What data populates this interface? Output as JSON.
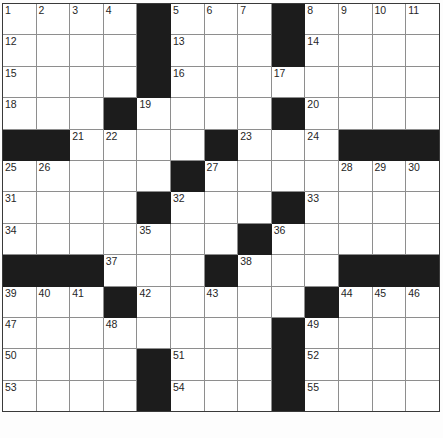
{
  "puzzle": {
    "kind": "crossword-grid",
    "rows": 13,
    "columns": 13,
    "cell_size_px": 33.7,
    "colors": {
      "block": "#1c1c1c",
      "open": "#ffffff",
      "grid_line": "#8e8e8e",
      "frame": "#3a3a3a",
      "number_text": "#262626"
    },
    "footer_artifact": "",
    "grid": [
      [
        {
          "type": "open",
          "number": "1"
        },
        {
          "type": "open",
          "number": "2"
        },
        {
          "type": "open",
          "number": "3"
        },
        {
          "type": "open",
          "number": "4"
        },
        {
          "type": "block",
          "number": ""
        },
        {
          "type": "open",
          "number": "5"
        },
        {
          "type": "open",
          "number": "6"
        },
        {
          "type": "open",
          "number": "7"
        },
        {
          "type": "block",
          "number": ""
        },
        {
          "type": "open",
          "number": "8"
        },
        {
          "type": "open",
          "number": "9"
        },
        {
          "type": "open",
          "number": "10"
        },
        {
          "type": "open",
          "number": "11"
        }
      ],
      [
        {
          "type": "open",
          "number": "12"
        },
        {
          "type": "open",
          "number": ""
        },
        {
          "type": "open",
          "number": ""
        },
        {
          "type": "open",
          "number": ""
        },
        {
          "type": "block",
          "number": ""
        },
        {
          "type": "open",
          "number": "13"
        },
        {
          "type": "open",
          "number": ""
        },
        {
          "type": "open",
          "number": ""
        },
        {
          "type": "block",
          "number": ""
        },
        {
          "type": "open",
          "number": "14"
        },
        {
          "type": "open",
          "number": ""
        },
        {
          "type": "open",
          "number": ""
        },
        {
          "type": "open",
          "number": ""
        }
      ],
      [
        {
          "type": "open",
          "number": "15"
        },
        {
          "type": "open",
          "number": ""
        },
        {
          "type": "open",
          "number": ""
        },
        {
          "type": "open",
          "number": ""
        },
        {
          "type": "block",
          "number": ""
        },
        {
          "type": "open",
          "number": "16"
        },
        {
          "type": "open",
          "number": ""
        },
        {
          "type": "open",
          "number": ""
        },
        {
          "type": "open",
          "number": "17"
        },
        {
          "type": "open",
          "number": ""
        },
        {
          "type": "open",
          "number": ""
        },
        {
          "type": "open",
          "number": ""
        },
        {
          "type": "open",
          "number": ""
        }
      ],
      [
        {
          "type": "open",
          "number": "18"
        },
        {
          "type": "open",
          "number": ""
        },
        {
          "type": "open",
          "number": ""
        },
        {
          "type": "block",
          "number": ""
        },
        {
          "type": "open",
          "number": "19"
        },
        {
          "type": "open",
          "number": ""
        },
        {
          "type": "open",
          "number": ""
        },
        {
          "type": "open",
          "number": ""
        },
        {
          "type": "block",
          "number": ""
        },
        {
          "type": "open",
          "number": "20"
        },
        {
          "type": "open",
          "number": ""
        },
        {
          "type": "open",
          "number": ""
        },
        {
          "type": "open",
          "number": ""
        }
      ],
      [
        {
          "type": "block",
          "number": ""
        },
        {
          "type": "block",
          "number": ""
        },
        {
          "type": "open",
          "number": "21"
        },
        {
          "type": "open",
          "number": "22"
        },
        {
          "type": "open",
          "number": ""
        },
        {
          "type": "open",
          "number": ""
        },
        {
          "type": "block",
          "number": ""
        },
        {
          "type": "open",
          "number": "23"
        },
        {
          "type": "open",
          "number": ""
        },
        {
          "type": "open",
          "number": "24"
        },
        {
          "type": "block",
          "number": ""
        },
        {
          "type": "block",
          "number": ""
        },
        {
          "type": "block",
          "number": ""
        }
      ],
      [
        {
          "type": "open",
          "number": "25"
        },
        {
          "type": "open",
          "number": "26"
        },
        {
          "type": "open",
          "number": ""
        },
        {
          "type": "open",
          "number": ""
        },
        {
          "type": "open",
          "number": ""
        },
        {
          "type": "block",
          "number": ""
        },
        {
          "type": "open",
          "number": "27"
        },
        {
          "type": "open",
          "number": ""
        },
        {
          "type": "open",
          "number": ""
        },
        {
          "type": "open",
          "number": ""
        },
        {
          "type": "open",
          "number": "28"
        },
        {
          "type": "open",
          "number": "29"
        },
        {
          "type": "open",
          "number": "30"
        }
      ],
      [
        {
          "type": "open",
          "number": "31"
        },
        {
          "type": "open",
          "number": ""
        },
        {
          "type": "open",
          "number": ""
        },
        {
          "type": "open",
          "number": ""
        },
        {
          "type": "block",
          "number": ""
        },
        {
          "type": "open",
          "number": "32"
        },
        {
          "type": "open",
          "number": ""
        },
        {
          "type": "open",
          "number": ""
        },
        {
          "type": "block",
          "number": ""
        },
        {
          "type": "open",
          "number": "33"
        },
        {
          "type": "open",
          "number": ""
        },
        {
          "type": "open",
          "number": ""
        },
        {
          "type": "open",
          "number": ""
        }
      ],
      [
        {
          "type": "open",
          "number": "34"
        },
        {
          "type": "open",
          "number": ""
        },
        {
          "type": "open",
          "number": ""
        },
        {
          "type": "open",
          "number": ""
        },
        {
          "type": "open",
          "number": "35"
        },
        {
          "type": "open",
          "number": ""
        },
        {
          "type": "open",
          "number": ""
        },
        {
          "type": "block",
          "number": ""
        },
        {
          "type": "open",
          "number": "36"
        },
        {
          "type": "open",
          "number": ""
        },
        {
          "type": "open",
          "number": ""
        },
        {
          "type": "open",
          "number": ""
        },
        {
          "type": "open",
          "number": ""
        }
      ],
      [
        {
          "type": "block",
          "number": ""
        },
        {
          "type": "block",
          "number": ""
        },
        {
          "type": "block",
          "number": ""
        },
        {
          "type": "open",
          "number": "37"
        },
        {
          "type": "open",
          "number": ""
        },
        {
          "type": "open",
          "number": ""
        },
        {
          "type": "block",
          "number": ""
        },
        {
          "type": "open",
          "number": "38"
        },
        {
          "type": "open",
          "number": ""
        },
        {
          "type": "open",
          "number": ""
        },
        {
          "type": "block",
          "number": ""
        },
        {
          "type": "block",
          "number": ""
        },
        {
          "type": "block",
          "number": ""
        }
      ],
      [
        {
          "type": "open",
          "number": "39"
        },
        {
          "type": "open",
          "number": "40"
        },
        {
          "type": "open",
          "number": "41"
        },
        {
          "type": "block",
          "number": ""
        },
        {
          "type": "open",
          "number": "42"
        },
        {
          "type": "open",
          "number": ""
        },
        {
          "type": "open",
          "number": "43"
        },
        {
          "type": "open",
          "number": ""
        },
        {
          "type": "open",
          "number": ""
        },
        {
          "type": "block",
          "number": ""
        },
        {
          "type": "open",
          "number": "44"
        },
        {
          "type": "open",
          "number": "45"
        },
        {
          "type": "open",
          "number": "46"
        }
      ],
      [
        {
          "type": "open",
          "number": "47"
        },
        {
          "type": "open",
          "number": ""
        },
        {
          "type": "open",
          "number": ""
        },
        {
          "type": "open",
          "number": "48"
        },
        {
          "type": "open",
          "number": ""
        },
        {
          "type": "open",
          "number": ""
        },
        {
          "type": "open",
          "number": ""
        },
        {
          "type": "open",
          "number": ""
        },
        {
          "type": "block",
          "number": ""
        },
        {
          "type": "open",
          "number": "49"
        },
        {
          "type": "open",
          "number": ""
        },
        {
          "type": "open",
          "number": ""
        },
        {
          "type": "open",
          "number": ""
        }
      ],
      [
        {
          "type": "open",
          "number": "50"
        },
        {
          "type": "open",
          "number": ""
        },
        {
          "type": "open",
          "number": ""
        },
        {
          "type": "open",
          "number": ""
        },
        {
          "type": "block",
          "number": ""
        },
        {
          "type": "open",
          "number": "51"
        },
        {
          "type": "open",
          "number": ""
        },
        {
          "type": "open",
          "number": ""
        },
        {
          "type": "block",
          "number": ""
        },
        {
          "type": "open",
          "number": "52"
        },
        {
          "type": "open",
          "number": ""
        },
        {
          "type": "open",
          "number": ""
        },
        {
          "type": "open",
          "number": ""
        }
      ],
      [
        {
          "type": "open",
          "number": "53"
        },
        {
          "type": "open",
          "number": ""
        },
        {
          "type": "open",
          "number": ""
        },
        {
          "type": "open",
          "number": ""
        },
        {
          "type": "block",
          "number": ""
        },
        {
          "type": "open",
          "number": "54"
        },
        {
          "type": "open",
          "number": ""
        },
        {
          "type": "open",
          "number": ""
        },
        {
          "type": "block",
          "number": ""
        },
        {
          "type": "open",
          "number": "55"
        },
        {
          "type": "open",
          "number": ""
        },
        {
          "type": "open",
          "number": ""
        },
        {
          "type": "open",
          "number": ""
        }
      ]
    ]
  }
}
